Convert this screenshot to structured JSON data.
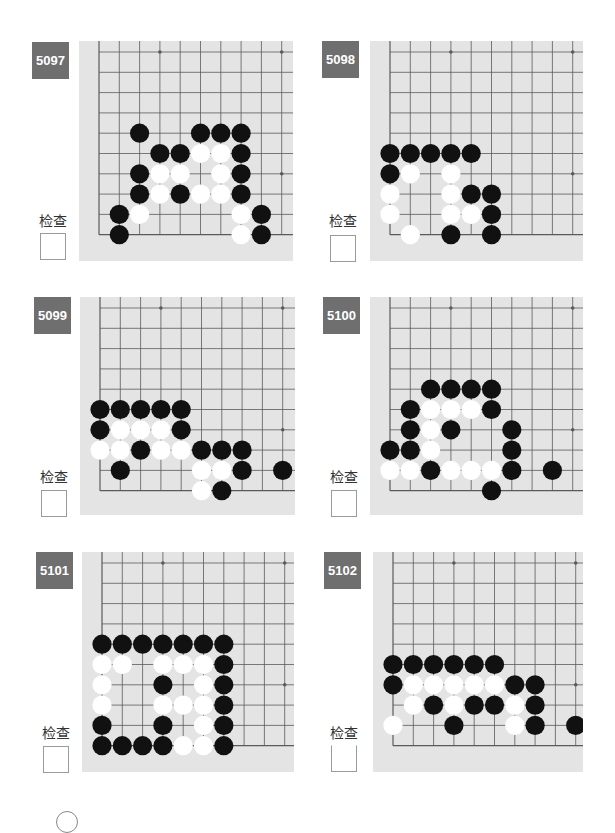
{
  "page": {
    "check_label": "检查",
    "colors": {
      "board": "#e4e4e4",
      "line": "#5a5a5a",
      "black_stone": "#111111",
      "white_stone": "#ffffff",
      "label_bg": "#6f6f6f"
    }
  },
  "problems": [
    {
      "number": "5097",
      "check_label": "检查",
      "stones": {
        "black": [
          [
            2,
            4
          ],
          [
            5,
            4
          ],
          [
            6,
            4
          ],
          [
            7,
            4
          ],
          [
            3,
            5
          ],
          [
            4,
            5
          ],
          [
            7,
            5
          ],
          [
            2,
            6
          ],
          [
            7,
            6
          ],
          [
            2,
            7
          ],
          [
            4,
            7
          ],
          [
            7,
            7
          ],
          [
            1,
            8
          ],
          [
            8,
            8
          ],
          [
            1,
            9
          ],
          [
            8,
            9
          ]
        ],
        "white": [
          [
            5,
            5
          ],
          [
            6,
            5
          ],
          [
            3,
            6
          ],
          [
            4,
            6
          ],
          [
            6,
            6
          ],
          [
            3,
            7
          ],
          [
            5,
            7
          ],
          [
            6,
            7
          ],
          [
            2,
            8
          ],
          [
            7,
            8
          ],
          [
            7,
            9
          ]
        ]
      }
    },
    {
      "number": "5098",
      "check_label": "检查",
      "stones": {
        "black": [
          [
            0,
            5
          ],
          [
            1,
            5
          ],
          [
            2,
            5
          ],
          [
            3,
            5
          ],
          [
            4,
            5
          ],
          [
            0,
            6
          ],
          [
            4,
            7
          ],
          [
            5,
            7
          ],
          [
            5,
            8
          ],
          [
            3,
            9
          ],
          [
            5,
            9
          ]
        ],
        "white": [
          [
            1,
            6
          ],
          [
            3,
            6
          ],
          [
            0,
            7
          ],
          [
            3,
            7
          ],
          [
            0,
            8
          ],
          [
            3,
            8
          ],
          [
            4,
            8
          ],
          [
            1,
            9
          ]
        ]
      }
    },
    {
      "number": "5099",
      "check_label": "检查",
      "stones": {
        "black": [
          [
            0,
            5
          ],
          [
            1,
            5
          ],
          [
            2,
            5
          ],
          [
            3,
            5
          ],
          [
            4,
            5
          ],
          [
            0,
            6
          ],
          [
            4,
            6
          ],
          [
            2,
            7
          ],
          [
            5,
            7
          ],
          [
            6,
            7
          ],
          [
            7,
            7
          ],
          [
            1,
            8
          ],
          [
            7,
            8
          ],
          [
            9,
            8
          ],
          [
            6,
            9
          ]
        ],
        "white": [
          [
            1,
            6
          ],
          [
            2,
            6
          ],
          [
            3,
            6
          ],
          [
            0,
            7
          ],
          [
            1,
            7
          ],
          [
            3,
            7
          ],
          [
            4,
            7
          ],
          [
            5,
            8
          ],
          [
            6,
            8
          ],
          [
            5,
            9
          ]
        ]
      }
    },
    {
      "number": "5100",
      "check_label": "检查",
      "stones": {
        "black": [
          [
            2,
            4
          ],
          [
            3,
            4
          ],
          [
            4,
            4
          ],
          [
            5,
            4
          ],
          [
            1,
            5
          ],
          [
            5,
            5
          ],
          [
            1,
            6
          ],
          [
            3,
            6
          ],
          [
            6,
            6
          ],
          [
            0,
            7
          ],
          [
            1,
            7
          ],
          [
            6,
            7
          ],
          [
            2,
            8
          ],
          [
            6,
            8
          ],
          [
            8,
            8
          ],
          [
            5,
            9
          ]
        ],
        "white": [
          [
            2,
            5
          ],
          [
            3,
            5
          ],
          [
            4,
            5
          ],
          [
            2,
            6
          ],
          [
            2,
            7
          ],
          [
            0,
            8
          ],
          [
            1,
            8
          ],
          [
            3,
            8
          ],
          [
            4,
            8
          ],
          [
            5,
            8
          ]
        ]
      }
    },
    {
      "number": "5101",
      "check_label": "检查",
      "stones": {
        "black": [
          [
            0,
            4
          ],
          [
            1,
            4
          ],
          [
            2,
            4
          ],
          [
            3,
            4
          ],
          [
            4,
            4
          ],
          [
            5,
            4
          ],
          [
            6,
            4
          ],
          [
            6,
            5
          ],
          [
            3,
            6
          ],
          [
            6,
            6
          ],
          [
            6,
            7
          ],
          [
            0,
            8
          ],
          [
            3,
            8
          ],
          [
            6,
            8
          ],
          [
            0,
            9
          ],
          [
            1,
            9
          ],
          [
            2,
            9
          ],
          [
            3,
            9
          ],
          [
            6,
            9
          ]
        ],
        "white": [
          [
            0,
            5
          ],
          [
            1,
            5
          ],
          [
            3,
            5
          ],
          [
            4,
            5
          ],
          [
            5,
            5
          ],
          [
            0,
            6
          ],
          [
            5,
            6
          ],
          [
            0,
            7
          ],
          [
            3,
            7
          ],
          [
            4,
            7
          ],
          [
            5,
            7
          ],
          [
            5,
            8
          ],
          [
            4,
            9
          ],
          [
            5,
            9
          ]
        ]
      }
    },
    {
      "number": "5102",
      "check_label": "检查",
      "stones": {
        "black": [
          [
            0,
            5
          ],
          [
            1,
            5
          ],
          [
            2,
            5
          ],
          [
            3,
            5
          ],
          [
            4,
            5
          ],
          [
            5,
            5
          ],
          [
            0,
            6
          ],
          [
            6,
            6
          ],
          [
            7,
            6
          ],
          [
            2,
            7
          ],
          [
            4,
            7
          ],
          [
            5,
            7
          ],
          [
            7,
            7
          ],
          [
            3,
            8
          ],
          [
            7,
            8
          ],
          [
            9,
            8
          ]
        ],
        "white": [
          [
            1,
            6
          ],
          [
            2,
            6
          ],
          [
            3,
            6
          ],
          [
            4,
            6
          ],
          [
            5,
            6
          ],
          [
            1,
            7
          ],
          [
            3,
            7
          ],
          [
            6,
            7
          ],
          [
            0,
            8
          ],
          [
            6,
            8
          ]
        ]
      }
    }
  ]
}
